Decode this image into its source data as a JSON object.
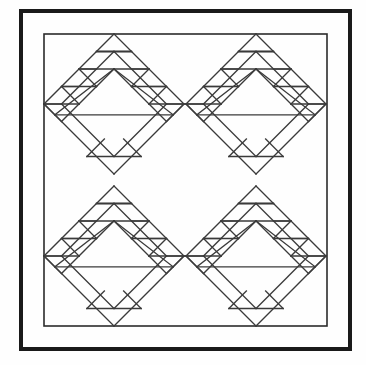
{
  "document": {
    "title": "Quilt Block Pattern Diagram",
    "kind": "line-drawing",
    "canvas": {
      "width": 366,
      "height": 365
    },
    "background_color": "#fefefe"
  },
  "frames": {
    "outer": {
      "name": "outer-border",
      "x": 21,
      "y": 11,
      "width": 329,
      "height": 338,
      "stroke_color": "#1a1a1a",
      "stroke_width": 4
    },
    "inner": {
      "name": "inner-border",
      "x": 44,
      "y": 34,
      "width": 283,
      "height": 292,
      "stroke_color": "#2b2b2b",
      "stroke_width": 1.6
    }
  },
  "motif": {
    "name": "diamond-sawtooth-block",
    "description": "Rotated square containing a large central triangle with stepped sawtooth triangle bands along both upper edges and two small triangles at the lower corners.",
    "half_diagonal": 70,
    "steps": 4,
    "stroke_color": "#3a3a3a",
    "stroke_width": 1.3,
    "centers": [
      {
        "label": "top-left",
        "cx": 114,
        "cy": 104
      },
      {
        "label": "top-right",
        "cx": 256,
        "cy": 104
      },
      {
        "label": "bottom-left",
        "cx": 114,
        "cy": 256
      },
      {
        "label": "bottom-right",
        "cx": 256,
        "cy": 256
      }
    ]
  },
  "legend": {
    "count_label": "4 blocks",
    "grid_label": "2 x 2"
  }
}
